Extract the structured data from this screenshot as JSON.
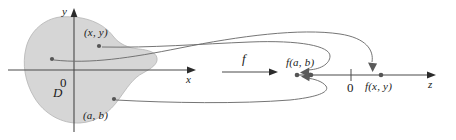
{
  "figure": {
    "colors": {
      "blob_fill": "#d6d6d6",
      "blob_stroke": "#b4b4b4",
      "axis": "#4a4a4a",
      "curve": "#6e6e6e",
      "point": "#555555",
      "text": "#1b1b1b",
      "background": "#ffffff"
    }
  },
  "domain_plane": {
    "y_axis_label": "y",
    "x_axis_label": "x",
    "origin_label": "0",
    "region_label": "D",
    "points": [
      {
        "name": "point-xy",
        "label": "(x, y)"
      },
      {
        "name": "point-ab",
        "label": "(a, b)"
      },
      {
        "name": "point-unlabeled",
        "label": ""
      }
    ]
  },
  "mapping": {
    "function_label": "f"
  },
  "range_line": {
    "axis_label": "z",
    "origin_label": "0",
    "values": [
      {
        "name": "value-fab",
        "label": "f(a, b)"
      },
      {
        "name": "value-fxy",
        "label": "f(x, y)"
      }
    ]
  }
}
